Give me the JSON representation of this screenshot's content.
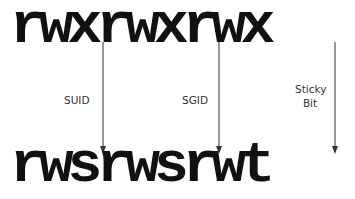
{
  "diagram": {
    "top_permissions": [
      "r",
      "w",
      "x",
      "r",
      "w",
      "x",
      "r",
      "w",
      "x"
    ],
    "bottom_permissions": [
      "r",
      "w",
      "s",
      "r",
      "w",
      "s",
      "r",
      "w",
      "t"
    ],
    "arrows": [
      {
        "label": "SUID",
        "from_index": 2,
        "to_index": 2
      },
      {
        "label": "SGID",
        "from_index": 5,
        "to_index": 5
      },
      {
        "label_line1": "Sticky",
        "label_line2": "Bit",
        "from_index": 8,
        "to_index": 8
      }
    ],
    "labels": {
      "suid": "SUID",
      "sgid": "SGID",
      "sticky_line1": "Sticky",
      "sticky_line2": "Bit"
    }
  }
}
